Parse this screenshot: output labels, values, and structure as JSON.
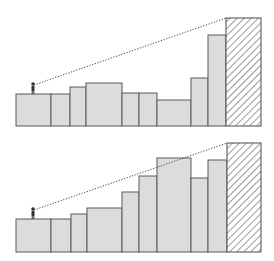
{
  "colors": {
    "building_fill": "#dcdcdc",
    "building_stroke": "#5a5a5a",
    "target_stroke": "#4a4a4a",
    "hatch": "#555555",
    "sightline": "#444444",
    "person": "#333333",
    "background": "#ffffff"
  },
  "panels": [
    {
      "name": "top-panel",
      "ground_y": 126,
      "observer": {
        "x": 33,
        "y": 94
      },
      "buildings": [
        {
          "x1": 16,
          "x2": 51,
          "top": 94
        },
        {
          "x1": 51,
          "x2": 70,
          "top": 94
        },
        {
          "x1": 70,
          "x2": 86,
          "top": 87
        },
        {
          "x1": 86,
          "x2": 122,
          "top": 83
        },
        {
          "x1": 122,
          "x2": 139,
          "top": 93
        },
        {
          "x1": 139,
          "x2": 157,
          "top": 93
        },
        {
          "x1": 157,
          "x2": 191,
          "top": 100
        },
        {
          "x1": 191,
          "x2": 208,
          "top": 78
        },
        {
          "x1": 208,
          "x2": 226,
          "top": 35
        }
      ],
      "target": {
        "x1": 226,
        "x2": 261,
        "top": 18
      }
    },
    {
      "name": "bottom-panel",
      "ground_y": 252,
      "observer": {
        "x": 33,
        "y": 219
      },
      "buildings": [
        {
          "x1": 16,
          "x2": 51,
          "top": 219
        },
        {
          "x1": 51,
          "x2": 71,
          "top": 219
        },
        {
          "x1": 71,
          "x2": 87,
          "top": 214
        },
        {
          "x1": 87,
          "x2": 122,
          "top": 208
        },
        {
          "x1": 122,
          "x2": 139,
          "top": 192
        },
        {
          "x1": 139,
          "x2": 157,
          "top": 176
        },
        {
          "x1": 157,
          "x2": 191,
          "top": 158
        },
        {
          "x1": 191,
          "x2": 208,
          "top": 178
        },
        {
          "x1": 208,
          "x2": 227,
          "top": 160
        }
      ],
      "target": {
        "x1": 227,
        "x2": 261,
        "top": 143
      }
    }
  ]
}
